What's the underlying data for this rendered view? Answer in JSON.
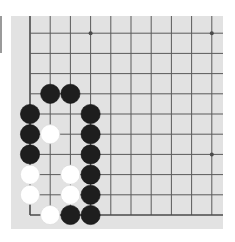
{
  "board": {
    "background": "#e2e2e2",
    "line_color": "#5a5a5a",
    "edge_color": "#4a4a4a",
    "origin_x": 19,
    "origin_y": 199,
    "spacing": 20.2,
    "visible_cols": 10,
    "visible_rows": 10,
    "edges": [
      "left",
      "bottom"
    ],
    "star_points": [
      [
        3,
        3
      ],
      [
        9,
        3
      ],
      [
        3,
        9
      ],
      [
        9,
        9
      ]
    ],
    "stone_radius": 9.6,
    "colors": {
      "black": "#1e1e1e",
      "white": "#ffffff"
    }
  },
  "stones": [
    {
      "color": "black",
      "col": 1,
      "row": 6
    },
    {
      "color": "black",
      "col": 2,
      "row": 6
    },
    {
      "color": "black",
      "col": 0,
      "row": 5
    },
    {
      "color": "black",
      "col": 3,
      "row": 5
    },
    {
      "color": "black",
      "col": 0,
      "row": 4
    },
    {
      "color": "white",
      "col": 1,
      "row": 4
    },
    {
      "color": "black",
      "col": 3,
      "row": 4
    },
    {
      "color": "black",
      "col": 0,
      "row": 3
    },
    {
      "color": "black",
      "col": 3,
      "row": 3
    },
    {
      "color": "white",
      "col": 0,
      "row": 2
    },
    {
      "color": "white",
      "col": 2,
      "row": 2
    },
    {
      "color": "black",
      "col": 3,
      "row": 2
    },
    {
      "color": "white",
      "col": 0,
      "row": 1
    },
    {
      "color": "white",
      "col": 2,
      "row": 1
    },
    {
      "color": "black",
      "col": 3,
      "row": 1
    },
    {
      "color": "white",
      "col": 1,
      "row": 0
    },
    {
      "color": "black",
      "col": 2,
      "row": 0
    },
    {
      "color": "black",
      "col": 3,
      "row": 0
    }
  ]
}
